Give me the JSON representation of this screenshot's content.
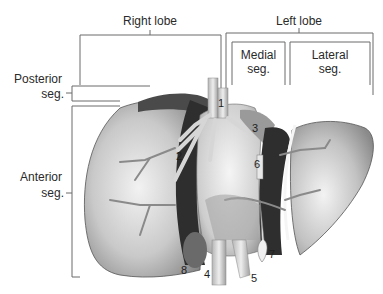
{
  "figure": {
    "lobes": {
      "right": "Right lobe",
      "left": "Left lobe"
    },
    "segments": {
      "posterior": [
        "Posterior",
        "seg."
      ],
      "anterior": [
        "Anterior",
        "seg."
      ],
      "medial": [
        "Medial",
        "seg."
      ],
      "lateral": [
        "Lateral",
        "seg."
      ]
    },
    "numbers": [
      "1",
      "2",
      "3",
      "4",
      "5",
      "6",
      "7",
      "8"
    ],
    "colors": {
      "bracket": "#6a6a6a",
      "liver_light": "#e6e6e6",
      "liver_mid": "#a8a8a8",
      "liver_dark": "#5a5a5a",
      "fissure": "#2e2e2e",
      "vessel": "#cfcfcf"
    }
  }
}
